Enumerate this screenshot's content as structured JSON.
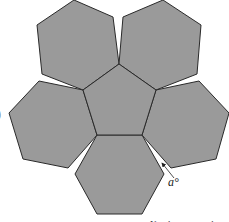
{
  "diagram": {
    "colors": {
      "fill": "#9a9a9a",
      "stroke": "#2a2a2a",
      "background": "#ffffff"
    },
    "pentagon": {
      "points": "119,64 156,90 142,135 97,135 83,90"
    },
    "hexagons": [
      {
        "name": "top-left",
        "points": "74,0 113,17 119,64 83,90 42,74 37,25"
      },
      {
        "name": "top-right",
        "points": "123,17 163,0 201,25 197,74 156,90 119,64"
      },
      {
        "name": "left",
        "points": "39,81 83,90 97,135 68,168 23,159 9,113"
      },
      {
        "name": "right",
        "points": "156,90 199,81 229,113 216,159 171,168 142,135"
      },
      {
        "name": "bottom",
        "points": "97,135 142,135 164,174 142,214 97,214 75,174"
      }
    ],
    "angle_label": {
      "text": "a°",
      "x": 168,
      "y": 186
    },
    "arrow": {
      "x1": 174,
      "y1": 178,
      "x2": 162,
      "y2": 163
    },
    "left_edge_glyph": ")",
    "bottom_cut_text": "Not drawn to scale"
  }
}
